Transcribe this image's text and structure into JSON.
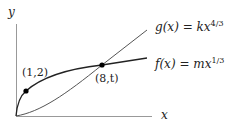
{
  "diagram": {
    "axes": {
      "x_label": "x",
      "y_label": "y"
    },
    "curves": [
      {
        "name": "g",
        "label_func": "g(x)",
        "equals": "=",
        "coef": "k",
        "var": "x",
        "exponent": "4/3"
      },
      {
        "name": "f",
        "label_func": "f(x)",
        "equals": "=",
        "coef": "m",
        "var": "x",
        "exponent": "1/3"
      }
    ],
    "points": [
      {
        "label": "(1,2)"
      },
      {
        "label": "(8,t)"
      }
    ],
    "colors": {
      "curve": "#222222",
      "axis": "#888888",
      "point": "#000000"
    }
  }
}
